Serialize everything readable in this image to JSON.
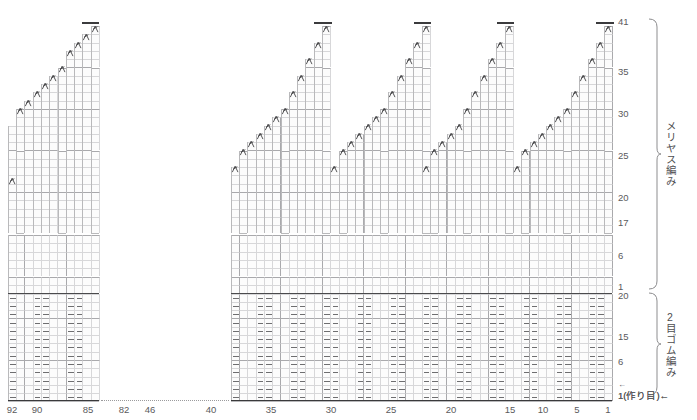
{
  "chart_data": {
    "type": "table",
    "title": "",
    "grid": {
      "cell_w": 8.3,
      "cell_h": 8.3,
      "major_every_x": 5,
      "major_every_y": 5
    },
    "x_axis": {
      "label_direction": "right-to-left",
      "ticks": [
        {
          "stitch": 92,
          "x": 12
        },
        {
          "stitch": 90,
          "x": 37
        },
        {
          "stitch": 85,
          "x": 88
        },
        {
          "stitch": 82,
          "x": 124
        },
        {
          "stitch": 46,
          "x": 150
        },
        {
          "stitch": 40,
          "x": 211
        },
        {
          "stitch": 35,
          "x": 271
        },
        {
          "stitch": 30,
          "x": 331
        },
        {
          "stitch": 25,
          "x": 391
        },
        {
          "stitch": 20,
          "x": 451
        },
        {
          "stitch": 15,
          "x": 510
        },
        {
          "stitch": 10,
          "x": 543
        },
        {
          "stitch": 5,
          "x": 577
        },
        {
          "stitch": 1,
          "x": 608
        }
      ]
    },
    "y_axis": {
      "label_direction": "bottom-to-top",
      "ticks": [
        {
          "row": "41",
          "y": 22
        },
        {
          "row": "35",
          "y": 72
        },
        {
          "row": "30",
          "y": 114
        },
        {
          "row": "25",
          "y": 156
        },
        {
          "row": "20",
          "y": 198
        },
        {
          "row": "17",
          "y": 223
        },
        {
          "row": "6",
          "y": 256
        },
        {
          "row": "1",
          "y": 287
        },
        {
          "row": "20",
          "y": 296
        },
        {
          "row": "15",
          "y": 337
        },
        {
          "row": "6",
          "y": 362
        },
        {
          "row": "1(作り目)←",
          "y": 394
        }
      ]
    },
    "sections": [
      {
        "name": "メリヤス編み",
        "romaji": "meriyasu-ami",
        "meaning": "stockinette stitch",
        "from_row": 1,
        "to_row": 41
      },
      {
        "name": "2目ゴム編み",
        "romaji": "2-me gomu-ami",
        "meaning": "2x2 rib",
        "from_row": 1,
        "to_row": 20
      }
    ],
    "symbols": [
      {
        "name": "left-slanting-decrease",
        "glyph": "人-slant",
        "meaning": "left-leaning decrease (左上2目一度)"
      },
      {
        "name": "purl-dash",
        "glyph": "–",
        "meaning": "purl stitch (裏編み)"
      },
      {
        "name": "bind-off-bar",
        "glyph": "▬",
        "meaning": "bind off / cast off edge"
      }
    ],
    "arrows": [
      {
        "name": "row-direction-top",
        "text": "←"
      },
      {
        "name": "cast-on-direction",
        "text": "←"
      }
    ]
  },
  "braces": [
    {
      "id": "stockinette",
      "label": "メリヤス編み",
      "top": 18,
      "height": 272
    },
    {
      "id": "rib",
      "label": "2目ゴム編み",
      "top": 292,
      "height": 104
    }
  ],
  "caston": {
    "text": "1(作り目)←",
    "arrow": "←"
  }
}
